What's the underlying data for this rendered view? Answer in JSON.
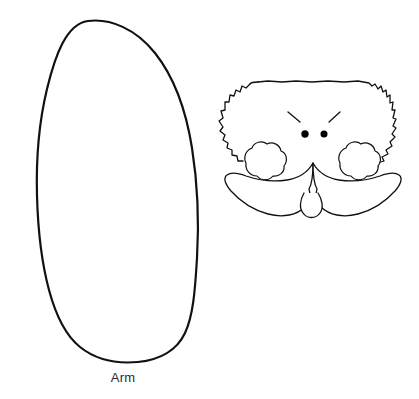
{
  "page": {
    "background_color": "#ffffff",
    "ink_color": "#111111",
    "width": 419,
    "height": 399
  },
  "pieces": [
    {
      "id": "arm",
      "label": "Arm",
      "shape": "tilted-rounded-oval",
      "outline_color": "#111111",
      "fill_color": "#ffffff",
      "stroke_width": 2.2,
      "label_color": "#2b2b2b",
      "label_font_size": "13px",
      "bounds": {
        "x": 30,
        "y": 18,
        "width": 170,
        "height": 345
      }
    },
    {
      "id": "santa-face",
      "label": "",
      "shape": "santa-head-with-mustache",
      "outline_color": "#111111",
      "fill_color": "#ffffff",
      "stroke_width": 1.3,
      "bounds": {
        "x": 218,
        "y": 78,
        "width": 185,
        "height": 145
      },
      "parts": [
        {
          "name": "hair",
          "style": "fuzzy-wavy-outline"
        },
        {
          "name": "eyebrow-left",
          "style": "short-diagonal-stroke"
        },
        {
          "name": "eyebrow-right",
          "style": "short-diagonal-stroke"
        },
        {
          "name": "eye-left",
          "style": "filled-dot",
          "color": "#000000",
          "radius": 3.6
        },
        {
          "name": "eye-right",
          "style": "filled-dot",
          "color": "#000000",
          "radius": 3.6
        },
        {
          "name": "cheek-left",
          "style": "scalloped-puff"
        },
        {
          "name": "cheek-right",
          "style": "scalloped-puff"
        },
        {
          "name": "mustache",
          "style": "handlebar-two-lobes"
        },
        {
          "name": "chin",
          "style": "small-rounded-lobe"
        }
      ]
    }
  ]
}
